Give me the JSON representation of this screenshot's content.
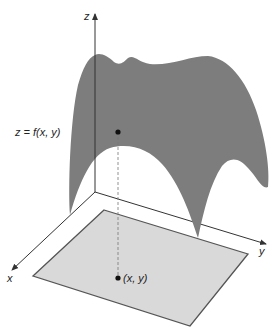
{
  "diagram": {
    "axes": {
      "z_label": "z",
      "x_label": "x",
      "y_label": "y"
    },
    "surface": {
      "label": "z = f(x, y)",
      "color": "#7d7d7d"
    },
    "domain_plane": {
      "color": "#d9d9d9",
      "edge_color": "#555555"
    },
    "point_label": "(x, y)"
  }
}
